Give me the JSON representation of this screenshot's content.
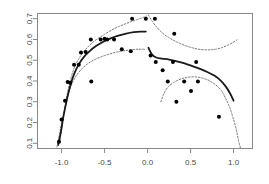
{
  "chart_data": {
    "type": "scatter",
    "title": "",
    "subtitle": "",
    "xlabel": "",
    "ylabel": "",
    "xlim": [
      -1.28,
      1.22
    ],
    "ylim": [
      0.075,
      0.725
    ],
    "grid": false,
    "legend": null,
    "xticks": [
      -1.0,
      -0.5,
      0.0,
      0.5,
      1.0
    ],
    "xticklabels": [
      "-1.0",
      "-0.5",
      "0.0",
      "0.5",
      "1.0"
    ],
    "yticks": [
      0.1,
      0.2,
      0.3,
      0.4,
      0.5,
      0.6,
      0.7
    ],
    "yticklabels": [
      "0.1",
      "0.2",
      "0.3",
      "0.4",
      "0.5",
      "0.6",
      "0.7"
    ],
    "box": true,
    "point_color": "#000000",
    "point_size": 2.0,
    "series": [
      {
        "name": "observations",
        "type": "scatter",
        "marker": "filled-circle",
        "points": [
          [
            -1.03,
            0.108
          ],
          [
            -1.0,
            0.215
          ],
          [
            -0.96,
            0.305
          ],
          [
            -0.93,
            0.395
          ],
          [
            -0.9,
            0.392
          ],
          [
            -0.855,
            0.478
          ],
          [
            -0.8,
            0.478
          ],
          [
            -0.775,
            0.537
          ],
          [
            -0.72,
            0.54
          ],
          [
            -0.66,
            0.6
          ],
          [
            -0.545,
            0.6
          ],
          [
            -0.5,
            0.603
          ],
          [
            -0.47,
            0.6
          ],
          [
            -0.39,
            0.6
          ],
          [
            -0.655,
            0.398
          ],
          [
            -0.3,
            0.553
          ],
          [
            -0.195,
            0.543
          ],
          [
            -0.18,
            0.7
          ],
          [
            -0.02,
            0.7
          ],
          [
            0.085,
            0.7
          ],
          [
            0.035,
            0.523
          ],
          [
            0.095,
            0.492
          ],
          [
            0.31,
            0.628
          ],
          [
            0.295,
            0.492
          ],
          [
            0.565,
            0.492
          ],
          [
            0.175,
            0.452
          ],
          [
            0.235,
            0.398
          ],
          [
            0.425,
            0.398
          ],
          [
            0.585,
            0.398
          ],
          [
            0.505,
            0.352
          ],
          [
            0.335,
            0.3
          ],
          [
            0.83,
            0.228
          ]
        ]
      },
      {
        "name": "fitted-curve-left",
        "type": "line",
        "style": "solid",
        "color": "#1a1a1a",
        "width": 1.8,
        "points": [
          [
            -1.04,
            0.092
          ],
          [
            -1.01,
            0.15
          ],
          [
            -0.985,
            0.215
          ],
          [
            -0.955,
            0.278
          ],
          [
            -0.925,
            0.335
          ],
          [
            -0.89,
            0.39
          ],
          [
            -0.85,
            0.438
          ],
          [
            -0.8,
            0.48
          ],
          [
            -0.74,
            0.516
          ],
          [
            -0.67,
            0.545
          ],
          [
            -0.6,
            0.568
          ],
          [
            -0.52,
            0.588
          ],
          [
            -0.43,
            0.605
          ],
          [
            -0.34,
            0.618
          ],
          [
            -0.25,
            0.628
          ],
          [
            -0.16,
            0.635
          ],
          [
            -0.08,
            0.638
          ],
          [
            -0.02,
            0.638
          ]
        ]
      },
      {
        "name": "fitted-curve-right",
        "type": "line",
        "style": "solid",
        "color": "#1a1a1a",
        "width": 1.8,
        "points": [
          [
            0.01,
            0.56
          ],
          [
            0.05,
            0.528
          ],
          [
            0.1,
            0.513
          ],
          [
            0.17,
            0.508
          ],
          [
            0.25,
            0.503
          ],
          [
            0.34,
            0.495
          ],
          [
            0.43,
            0.485
          ],
          [
            0.52,
            0.472
          ],
          [
            0.61,
            0.458
          ],
          [
            0.7,
            0.442
          ],
          [
            0.78,
            0.425
          ],
          [
            0.85,
            0.402
          ],
          [
            0.91,
            0.373
          ],
          [
            0.96,
            0.34
          ],
          [
            1.0,
            0.305
          ]
        ]
      },
      {
        "name": "upper-confidence-band-left",
        "type": "line",
        "style": "dashed",
        "color": "#777777",
        "width": 1.0,
        "points": [
          [
            -1.02,
            0.115
          ],
          [
            -0.99,
            0.19
          ],
          [
            -0.965,
            0.265
          ],
          [
            -0.935,
            0.335
          ],
          [
            -0.9,
            0.4
          ],
          [
            -0.86,
            0.455
          ],
          [
            -0.81,
            0.5
          ],
          [
            -0.75,
            0.537
          ],
          [
            -0.68,
            0.57
          ],
          [
            -0.6,
            0.598
          ],
          [
            -0.51,
            0.622
          ],
          [
            -0.42,
            0.645
          ],
          [
            -0.33,
            0.663
          ],
          [
            -0.24,
            0.678
          ],
          [
            -0.16,
            0.69
          ],
          [
            -0.09,
            0.7
          ],
          [
            -0.04,
            0.708
          ],
          [
            -0.01,
            0.713
          ]
        ]
      },
      {
        "name": "lower-confidence-band-left",
        "type": "line",
        "style": "dashed",
        "color": "#777777",
        "width": 1.0,
        "points": [
          [
            -1.055,
            0.082
          ],
          [
            -1.035,
            0.12
          ],
          [
            -1.01,
            0.175
          ],
          [
            -0.98,
            0.235
          ],
          [
            -0.95,
            0.29
          ],
          [
            -0.915,
            0.345
          ],
          [
            -0.875,
            0.39
          ],
          [
            -0.825,
            0.428
          ],
          [
            -0.765,
            0.458
          ],
          [
            -0.7,
            0.482
          ],
          [
            -0.62,
            0.502
          ],
          [
            -0.53,
            0.518
          ],
          [
            -0.44,
            0.53
          ],
          [
            -0.35,
            0.54
          ],
          [
            -0.25,
            0.547
          ],
          [
            -0.15,
            0.552
          ],
          [
            -0.06,
            0.553
          ],
          [
            -0.02,
            0.553
          ]
        ]
      },
      {
        "name": "upper-confidence-band-right",
        "type": "line",
        "style": "dashed",
        "color": "#777777",
        "width": 1.0,
        "points": [
          [
            0.01,
            0.718
          ],
          [
            0.05,
            0.69
          ],
          [
            0.1,
            0.662
          ],
          [
            0.17,
            0.632
          ],
          [
            0.25,
            0.608
          ],
          [
            0.34,
            0.588
          ],
          [
            0.43,
            0.572
          ],
          [
            0.52,
            0.56
          ],
          [
            0.61,
            0.552
          ],
          [
            0.7,
            0.55
          ],
          [
            0.78,
            0.552
          ],
          [
            0.86,
            0.56
          ],
          [
            0.93,
            0.572
          ],
          [
            0.99,
            0.585
          ],
          [
            1.04,
            0.598
          ]
        ]
      },
      {
        "name": "lower-confidence-band-right",
        "type": "line",
        "style": "dashed",
        "color": "#777777",
        "width": 1.0,
        "points": [
          [
            0.155,
            0.3
          ],
          [
            0.19,
            0.34
          ],
          [
            0.24,
            0.372
          ],
          [
            0.31,
            0.395
          ],
          [
            0.39,
            0.41
          ],
          [
            0.47,
            0.418
          ],
          [
            0.55,
            0.42
          ],
          [
            0.63,
            0.415
          ],
          [
            0.71,
            0.403
          ],
          [
            0.78,
            0.385
          ],
          [
            0.85,
            0.358
          ],
          [
            0.9,
            0.322
          ],
          [
            0.95,
            0.278
          ],
          [
            0.99,
            0.228
          ],
          [
            1.03,
            0.168
          ],
          [
            1.06,
            0.108
          ],
          [
            1.08,
            0.078
          ]
        ]
      }
    ]
  }
}
